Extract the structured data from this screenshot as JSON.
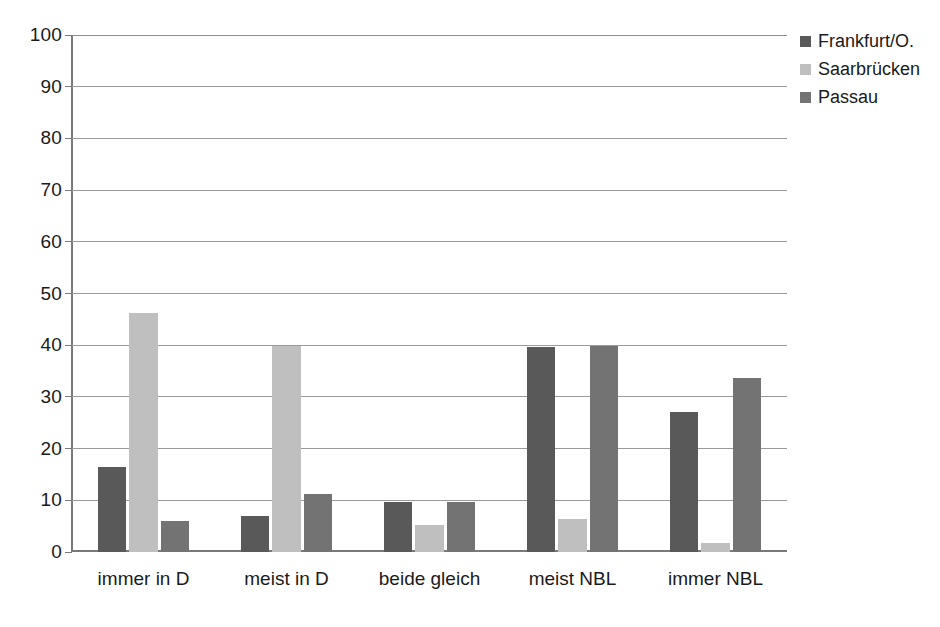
{
  "chart_data": {
    "type": "bar",
    "title": "",
    "xlabel": "",
    "ylabel": "",
    "ylim": [
      0,
      100
    ],
    "ytick_step": 10,
    "yticks": [
      100,
      90,
      80,
      70,
      60,
      50,
      40,
      30,
      20,
      10,
      0
    ],
    "grid": true,
    "legend_position": "right-top",
    "categories": [
      "immer in D",
      "meist in D",
      "beide gleich",
      "meist NBL",
      "immer NBL"
    ],
    "series": [
      {
        "name": "Frankfurt/O.",
        "color": "#595959",
        "values": [
          16.5,
          7.0,
          9.7,
          39.6,
          27.1
        ]
      },
      {
        "name": "Saarbrücken",
        "color": "#bfbfbf",
        "values": [
          46.2,
          39.9,
          5.3,
          6.4,
          1.7
        ]
      },
      {
        "name": "Passau",
        "color": "#737373",
        "values": [
          6.0,
          11.2,
          9.6,
          39.9,
          33.7
        ]
      }
    ]
  },
  "legend": {
    "items": [
      {
        "label": "Frankfurt/O.",
        "swatch": "legend-swatch-frankfurt"
      },
      {
        "label": "Saarbrücken",
        "swatch": "legend-swatch-saarbruecken"
      },
      {
        "label": "Passau",
        "swatch": "legend-swatch-passau"
      }
    ]
  },
  "colors": {
    "frankfurt": "#595959",
    "saarbruecken": "#bfbfbf",
    "passau": "#737373",
    "gridline": "#9a9a9a",
    "axis": "#7a7a7a",
    "text": "#1a1a1a",
    "background": "#ffffff"
  }
}
